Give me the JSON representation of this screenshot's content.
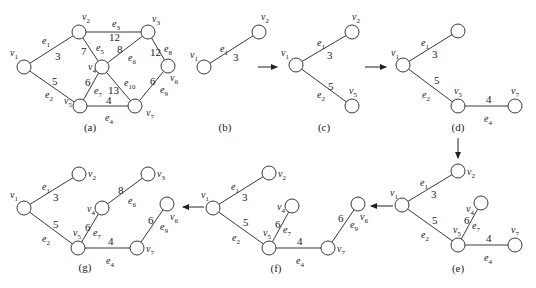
{
  "figure": {
    "node_radius": 7,
    "panels": [
      {
        "id": "a",
        "caption": "(a)",
        "caption_pos": [
          90,
          131
        ],
        "nodes": [
          {
            "id": "v1",
            "label": "v1",
            "x": 24,
            "y": 67,
            "lx": 10,
            "ly": 56
          },
          {
            "id": "v2",
            "label": "v2",
            "x": 79,
            "y": 32,
            "lx": 82,
            "ly": 20
          },
          {
            "id": "v3",
            "label": "v3",
            "x": 148,
            "y": 32,
            "lx": 152,
            "ly": 22
          },
          {
            "id": "v4",
            "label": "v4",
            "x": 102,
            "y": 67,
            "lx": 88,
            "ly": 70
          },
          {
            "id": "v5",
            "label": "v5",
            "x": 80,
            "y": 106,
            "lx": 64,
            "ly": 104
          },
          {
            "id": "v6",
            "label": "v6",
            "x": 168,
            "y": 66,
            "lx": 170,
            "ly": 81
          },
          {
            "id": "v7",
            "label": "v7",
            "x": 135,
            "y": 106,
            "lx": 146,
            "ly": 116
          }
        ],
        "edges": [
          {
            "from": "v1",
            "to": "v2",
            "name": "e1",
            "weight": "3",
            "nx": 42,
            "ny": 44,
            "wx": 55,
            "wy": 60
          },
          {
            "from": "v1",
            "to": "v5",
            "name": "e2",
            "weight": "5",
            "nx": 45,
            "ny": 98,
            "wx": 52,
            "wy": 85
          },
          {
            "from": "v2",
            "to": "v3",
            "name": "e3",
            "weight": "12",
            "nx": 112,
            "ny": 27,
            "wx": 109,
            "wy": 41
          },
          {
            "from": "v5",
            "to": "v7",
            "name": "e4",
            "weight": "4",
            "nx": 105,
            "ny": 121,
            "wx": 106,
            "wy": 104
          },
          {
            "from": "v2",
            "to": "v4",
            "name": "e5",
            "weight": "7",
            "nx": 96,
            "ny": 51,
            "wx": 81,
            "wy": 55
          },
          {
            "from": "v4",
            "to": "v3",
            "name": "e6",
            "weight": "8",
            "nx": 128,
            "ny": 61,
            "wx": 117,
            "wy": 53
          },
          {
            "from": "v4",
            "to": "v5",
            "name": "e7",
            "weight": "6",
            "nx": 94,
            "ny": 94,
            "wx": 85,
            "wy": 86
          },
          {
            "from": "v3",
            "to": "v6",
            "name": "e8",
            "weight": "12",
            "nx": 164,
            "ny": 52,
            "wx": 150,
            "wy": 56
          },
          {
            "from": "v7",
            "to": "v6",
            "name": "e9",
            "weight": "6",
            "nx": 160,
            "ny": 93,
            "wx": 150,
            "wy": 85
          },
          {
            "from": "v4",
            "to": "v7",
            "name": "e10",
            "weight": "13",
            "nx": 124,
            "ny": 86,
            "wx": 108,
            "wy": 94
          }
        ]
      },
      {
        "id": "b",
        "caption": "(b)",
        "caption_pos": [
          225,
          131
        ],
        "nodes": [
          {
            "id": "v1",
            "label": "v1",
            "x": 204,
            "y": 67,
            "lx": 190,
            "ly": 58
          },
          {
            "id": "v2",
            "label": "v2",
            "x": 259,
            "y": 32,
            "lx": 261,
            "ly": 20
          }
        ],
        "edges": [
          {
            "from": "v1",
            "to": "v2",
            "name": "e1",
            "weight": "3",
            "nx": 220,
            "ny": 52,
            "wx": 233,
            "wy": 61
          }
        ]
      },
      {
        "id": "c",
        "caption": "(c)",
        "caption_pos": [
          324,
          131
        ],
        "nodes": [
          {
            "id": "v1",
            "label": "v1",
            "x": 296,
            "y": 65,
            "lx": 281,
            "ly": 56
          },
          {
            "id": "v2",
            "label": "v2",
            "x": 352,
            "y": 32,
            "lx": 352,
            "ly": 20
          },
          {
            "id": "v5",
            "label": "v5",
            "x": 352,
            "y": 106,
            "lx": 349,
            "ly": 94
          }
        ],
        "edges": [
          {
            "from": "v1",
            "to": "v2",
            "name": "e1",
            "weight": "3",
            "nx": 317,
            "ny": 46,
            "wx": 327,
            "wy": 59
          },
          {
            "from": "v1",
            "to": "v5",
            "name": "e2",
            "weight": "5",
            "nx": 317,
            "ny": 98,
            "wx": 328,
            "wy": 90
          }
        ]
      },
      {
        "id": "d",
        "caption": "(d)",
        "caption_pos": [
          458,
          131
        ],
        "nodes": [
          {
            "id": "v1",
            "label": "v1",
            "x": 403,
            "y": 65,
            "lx": 391,
            "ly": 56
          },
          {
            "id": "v2",
            "label": "",
            "x": 458,
            "y": 31,
            "lx": 0,
            "ly": 0
          },
          {
            "id": "v5",
            "label": "v5",
            "x": 458,
            "y": 106,
            "lx": 454,
            "ly": 94
          },
          {
            "id": "v7",
            "label": "v7",
            "x": 515,
            "y": 106,
            "lx": 511,
            "ly": 94
          }
        ],
        "edges": [
          {
            "from": "v1",
            "to": "v2",
            "name": "e1",
            "weight": "3",
            "nx": 421,
            "ny": 46,
            "wx": 432,
            "wy": 58
          },
          {
            "from": "v1",
            "to": "v5",
            "name": "e2",
            "weight": "5",
            "nx": 422,
            "ny": 98,
            "wx": 434,
            "wy": 84
          },
          {
            "from": "v5",
            "to": "v7",
            "name": "e4",
            "weight": "4",
            "nx": 484,
            "ny": 122,
            "wx": 486,
            "wy": 103
          }
        ]
      },
      {
        "id": "e",
        "caption": "(e)",
        "caption_pos": [
          458,
          272
        ],
        "nodes": [
          {
            "id": "v1",
            "label": "v1",
            "x": 402,
            "y": 205,
            "lx": 390,
            "ly": 196
          },
          {
            "id": "v2",
            "label": "v2",
            "x": 458,
            "y": 171,
            "lx": 467,
            "ly": 175
          },
          {
            "id": "v4",
            "label": "v4",
            "x": 481,
            "y": 203,
            "lx": 466,
            "ly": 212
          },
          {
            "id": "v5",
            "label": "v5",
            "x": 458,
            "y": 245,
            "lx": 453,
            "ly": 233
          },
          {
            "id": "v7",
            "label": "v7",
            "x": 515,
            "y": 245,
            "lx": 511,
            "ly": 233
          }
        ],
        "edges": [
          {
            "from": "v1",
            "to": "v2",
            "name": "e1",
            "weight": "3",
            "nx": 420,
            "ny": 186,
            "wx": 431,
            "wy": 198
          },
          {
            "from": "v1",
            "to": "v5",
            "name": "e2",
            "weight": "5",
            "nx": 421,
            "ny": 238,
            "wx": 432,
            "wy": 224
          },
          {
            "from": "v5",
            "to": "v4",
            "name": "e7",
            "weight": "6",
            "nx": 472,
            "ny": 229,
            "wx": 464,
            "wy": 224
          },
          {
            "from": "v5",
            "to": "v7",
            "name": "e4",
            "weight": "4",
            "nx": 484,
            "ny": 261,
            "wx": 486,
            "wy": 242
          }
        ]
      },
      {
        "id": "f",
        "caption": "(f)",
        "caption_pos": [
          276,
          272
        ],
        "nodes": [
          {
            "id": "v1",
            "label": "v1",
            "x": 213,
            "y": 208,
            "lx": 201,
            "ly": 198
          },
          {
            "id": "v2",
            "label": "v2",
            "x": 269,
            "y": 173,
            "lx": 278,
            "ly": 177
          },
          {
            "id": "v4",
            "label": "v4",
            "x": 292,
            "y": 206,
            "lx": 277,
            "ly": 210
          },
          {
            "id": "v5",
            "label": "v5",
            "x": 269,
            "y": 248,
            "lx": 263,
            "ly": 236
          },
          {
            "id": "v7",
            "label": "v7",
            "x": 328,
            "y": 248,
            "lx": 337,
            "ly": 252
          },
          {
            "id": "v6",
            "label": "v6",
            "x": 358,
            "y": 204,
            "lx": 360,
            "ly": 220
          }
        ],
        "edges": [
          {
            "from": "v1",
            "to": "v2",
            "name": "e1",
            "weight": "3",
            "nx": 231,
            "ny": 190,
            "wx": 242,
            "wy": 201
          },
          {
            "from": "v1",
            "to": "v5",
            "name": "e2",
            "weight": "5",
            "nx": 232,
            "ny": 241,
            "wx": 243,
            "wy": 226
          },
          {
            "from": "v5",
            "to": "v4",
            "name": "e7",
            "weight": "6",
            "nx": 283,
            "ny": 233,
            "wx": 275,
            "wy": 228
          },
          {
            "from": "v5",
            "to": "v7",
            "name": "e4",
            "weight": "4",
            "nx": 296,
            "ny": 264,
            "wx": 297,
            "wy": 245
          },
          {
            "from": "v7",
            "to": "v6",
            "name": "e9",
            "weight": "6",
            "nx": 350,
            "ny": 228,
            "wx": 338,
            "wy": 222
          }
        ]
      },
      {
        "id": "g",
        "caption": "(g)",
        "caption_pos": [
          85,
          271
        ],
        "nodes": [
          {
            "id": "v1",
            "label": "v1",
            "x": 24,
            "y": 208,
            "lx": 10,
            "ly": 198
          },
          {
            "id": "v2",
            "label": "v2",
            "x": 79,
            "y": 174,
            "lx": 88,
            "ly": 177
          },
          {
            "id": "v3",
            "label": "v3",
            "x": 148,
            "y": 174,
            "lx": 157,
            "ly": 177
          },
          {
            "id": "v4",
            "label": "v4",
            "x": 102,
            "y": 208,
            "lx": 87,
            "ly": 212
          },
          {
            "id": "v5",
            "label": "v5",
            "x": 78,
            "y": 248,
            "lx": 73,
            "ly": 236
          },
          {
            "id": "v7",
            "label": "v7",
            "x": 137,
            "y": 248,
            "lx": 146,
            "ly": 252
          },
          {
            "id": "v6",
            "label": "v6",
            "x": 167,
            "y": 204,
            "lx": 170,
            "ly": 220
          }
        ],
        "edges": [
          {
            "from": "v1",
            "to": "v2",
            "name": "e1",
            "weight": "3",
            "nx": 42,
            "ny": 190,
            "wx": 53,
            "wy": 201
          },
          {
            "from": "v1",
            "to": "v5",
            "name": "e2",
            "weight": "5",
            "nx": 42,
            "ny": 242,
            "wx": 53,
            "wy": 228
          },
          {
            "from": "v4",
            "to": "v3",
            "name": "e6",
            "weight": "8",
            "nx": 128,
            "ny": 204,
            "wx": 118,
            "wy": 194
          },
          {
            "from": "v5",
            "to": "v4",
            "name": "e7",
            "weight": "6",
            "nx": 93,
            "ny": 236,
            "wx": 85,
            "wy": 231
          },
          {
            "from": "v5",
            "to": "v7",
            "name": "e4",
            "weight": "4",
            "nx": 106,
            "ny": 264,
            "wx": 108,
            "wy": 245
          },
          {
            "from": "v7",
            "to": "v6",
            "name": "e9",
            "weight": "6",
            "nx": 160,
            "ny": 230,
            "wx": 148,
            "wy": 224
          }
        ]
      }
    ],
    "arrows": [
      {
        "from": "b",
        "to": "c",
        "x1": 258,
        "y1": 67,
        "x2": 277,
        "y2": 67
      },
      {
        "from": "c",
        "to": "d",
        "x1": 365,
        "y1": 67,
        "x2": 386,
        "y2": 67
      },
      {
        "from": "d",
        "to": "e",
        "x1": 458,
        "y1": 138,
        "x2": 458,
        "y2": 158
      },
      {
        "from": "e",
        "to": "f",
        "x1": 393,
        "y1": 206,
        "x2": 371,
        "y2": 206
      },
      {
        "from": "f",
        "to": "g",
        "x1": 204,
        "y1": 207,
        "x2": 183,
        "y2": 207
      }
    ]
  }
}
